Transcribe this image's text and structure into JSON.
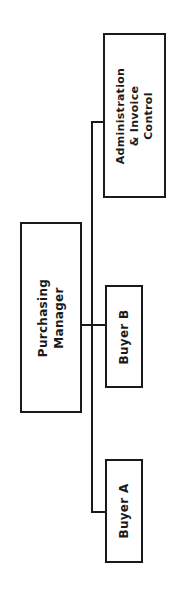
{
  "diagram": {
    "type": "org-chart",
    "orientation": "rotated-90-ccw",
    "line_color": "#1a1a1a",
    "nodes": [
      {
        "id": "manager",
        "line1": "Purchasing",
        "line2": "Manager",
        "line3": ""
      },
      {
        "id": "admin",
        "line1": "Administration",
        "line2": "& Invoice",
        "line3": "Control"
      },
      {
        "id": "buyer_b",
        "line1": "Buyer B"
      },
      {
        "id": "buyer_a",
        "line1": "Buyer A"
      }
    ],
    "edges": [
      {
        "from": "manager",
        "to": "admin"
      },
      {
        "from": "manager",
        "to": "buyer_b"
      },
      {
        "from": "manager",
        "to": "buyer_a"
      }
    ]
  }
}
